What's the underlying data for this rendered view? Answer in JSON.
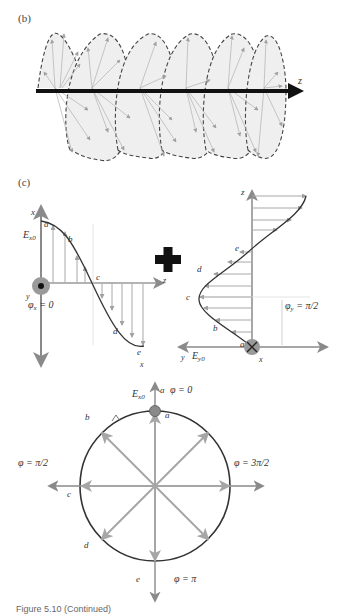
{
  "figure": {
    "panels": {
      "b": {
        "label": "(b)",
        "axis_label": "z",
        "description": "Circularly polarized E-field vectors rotating along z, enclosed by a dashed helix envelope"
      },
      "c": {
        "label": "(c)",
        "left_plot": {
          "axis_x_top": "x",
          "axis_x_bottom": "x",
          "axis_z": "z",
          "axis_y": "y",
          "amplitude": "Ex0",
          "phase": "φx = 0",
          "points": [
            "a",
            "b",
            "c",
            "d",
            "e"
          ]
        },
        "plus_symbol": "+",
        "right_plot": {
          "axis_z": "z",
          "axis_y": "y",
          "axis_x": "x",
          "amplitude": "Ey0",
          "phase": "φy = π/2",
          "points": [
            "a",
            "b",
            "c",
            "d",
            "e"
          ]
        }
      },
      "circle": {
        "top_label": "φ = 0",
        "left_label": "φ = π/2",
        "right_label": "φ = 3π/2",
        "bottom_label": "φ = π",
        "amplitude": "Ex0",
        "point_labels": {
          "a_top": "a",
          "a_inner": "a",
          "b": "b",
          "c": "c",
          "d": "d",
          "e": "e"
        }
      }
    },
    "caption": "Figure 5.10  (Continued)"
  },
  "colors": {
    "vector_gray": "#a8a8a8",
    "axis_gray": "#8a8a8a",
    "curve_dark": "#333333",
    "z_axis_black": "#111111",
    "envelope_fill": "#efefef",
    "marker_fill": "#9a9a9a"
  }
}
